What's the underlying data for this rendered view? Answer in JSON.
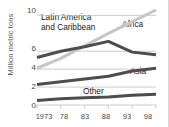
{
  "chart_data": {
    "type": "line",
    "title": "",
    "xlabel": "",
    "ylabel": "Million metric tons",
    "x": [
      1973,
      1978,
      1983,
      1988,
      1993,
      1998
    ],
    "xticklabels": [
      "1973",
      "78",
      "83",
      "88",
      "93",
      "98"
    ],
    "yticks": [
      0,
      2,
      4,
      6,
      10
    ],
    "yticklabels": [
      "0",
      "2",
      "4",
      "6",
      "10"
    ],
    "ylim": [
      0,
      10.6
    ],
    "grid": "horizontal",
    "legend": "inline-labels",
    "series": [
      {
        "name": "Africa",
        "color": "#c6c6c6",
        "values": [
          4.1,
          5.2,
          6.6,
          8.0,
          9.3,
          10.6
        ]
      },
      {
        "name": "Latin America and Caribbean",
        "color": "#4d4d4d",
        "values": [
          5.3,
          6.0,
          6.5,
          7.1,
          5.9,
          5.6
        ]
      },
      {
        "name": "Asia",
        "color": "#4d4d4d",
        "values": [
          2.3,
          2.6,
          2.9,
          3.2,
          3.8,
          4.1
        ]
      },
      {
        "name": "Other",
        "color": "#4d4d4d",
        "values": [
          0.5,
          0.7,
          0.8,
          0.9,
          1.1,
          1.2
        ]
      }
    ],
    "annotations": [
      {
        "text": "Latin America\nand Caribbean",
        "series": "Latin America and Caribbean"
      },
      {
        "text": "Africa",
        "series": "Africa"
      },
      {
        "text": "Asia",
        "series": "Asia"
      },
      {
        "text": "Other",
        "series": "Other"
      }
    ]
  },
  "labels": {
    "y_axis_title": "Million metric tons",
    "latam_line1": "Latin America",
    "latam_line2": "and Caribbean",
    "africa": "Africa",
    "asia": "Asia",
    "other": "Other"
  },
  "colors": {
    "dark_line": "#4d4d4d",
    "light_line": "#c6c6c6",
    "gridline": "#bfbfbf",
    "text": "#4a4a4a",
    "background": "#ffffff"
  }
}
